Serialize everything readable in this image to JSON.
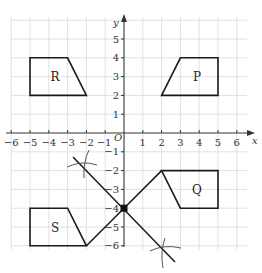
{
  "diagram": {
    "title": "",
    "axes": {
      "x_label": "x",
      "y_label": "y",
      "origin_label": "O",
      "x_range": [
        -6,
        6
      ],
      "y_range": [
        -6,
        5
      ],
      "x_ticks": [
        -6,
        -5,
        -4,
        -3,
        -2,
        -1,
        1,
        2,
        3,
        4,
        5,
        6
      ],
      "y_ticks": [
        5,
        4,
        3,
        2,
        1,
        -1,
        -2,
        -3,
        -4,
        -5,
        -6
      ]
    },
    "shapes": [
      {
        "label": "R",
        "vertices": [
          [
            -5,
            2
          ],
          [
            -5,
            4
          ],
          [
            -3,
            4
          ],
          [
            -2,
            2
          ]
        ]
      },
      {
        "label": "P",
        "vertices": [
          [
            2,
            2
          ],
          [
            3,
            4
          ],
          [
            5,
            4
          ],
          [
            5,
            2
          ]
        ]
      },
      {
        "label": "Q",
        "vertices": [
          [
            2,
            -2
          ],
          [
            5,
            -2
          ],
          [
            5,
            -4
          ],
          [
            3,
            -4
          ]
        ]
      },
      {
        "label": "S",
        "vertices": [
          [
            -5,
            -4
          ],
          [
            -3,
            -4
          ],
          [
            -2,
            -6
          ],
          [
            -5,
            -6
          ]
        ]
      }
    ],
    "construction": {
      "bisector_line": {
        "from": [
          -2.8,
          -1.3
        ],
        "to": [
          2.7,
          -6.7
        ]
      },
      "connector_lines": [
        {
          "from": [
            2,
            -2
          ],
          "to": [
            0,
            -4
          ]
        },
        {
          "from": [
            0,
            -4
          ],
          "to": [
            -2,
            -6
          ]
        }
      ],
      "intersection_point": [
        0,
        -4
      ],
      "arc_marks": [
        [
          -2.3,
          -1.8
        ],
        [
          1.8,
          -6.2
        ]
      ]
    }
  },
  "labels": {
    "x_axis": "x",
    "y_axis": "y",
    "origin": "O",
    "shape_R": "R",
    "shape_P": "P",
    "shape_Q": "Q",
    "shape_S": "S",
    "xt_m6": "−6",
    "xt_m5": "−5",
    "xt_m4": "−4",
    "xt_m3": "−3",
    "xt_m2": "−2",
    "xt_m1": "−1",
    "xt_1": "1",
    "xt_2": "2",
    "xt_3": "3",
    "xt_4": "4",
    "xt_5": "5",
    "xt_6": "6",
    "yt_5": "5",
    "yt_4": "4",
    "yt_3": "3",
    "yt_2": "2",
    "yt_1": "1",
    "yt_m1": "−1",
    "yt_m2": "−2",
    "yt_m3": "−3",
    "yt_m4": "−4",
    "yt_m5": "−5",
    "yt_m6": "−6"
  }
}
